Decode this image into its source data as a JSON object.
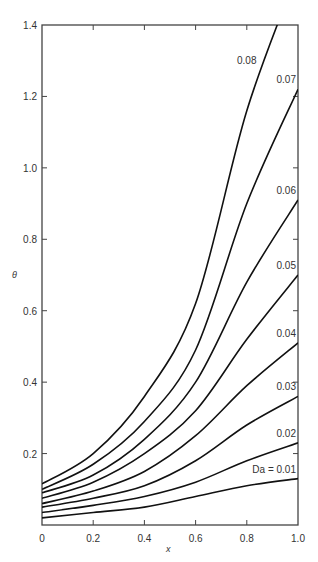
{
  "chart_data": {
    "type": "line",
    "title": "",
    "xlabel": "x",
    "ylabel": "θ",
    "xlim": [
      0,
      1.0
    ],
    "ylim": [
      0,
      1.4
    ],
    "grid": false,
    "legend": "inline labels at curve ends",
    "x_ticks": [
      "0",
      "0.2",
      "0.4",
      "0.6",
      "0.8",
      "1.0"
    ],
    "y_ticks": [
      "0.2",
      "0.4",
      "0.6",
      "0.8",
      "1.0",
      "1.2",
      "1.4"
    ],
    "x": [
      0,
      0.2,
      0.4,
      0.6,
      0.8,
      1.0
    ],
    "series": [
      {
        "name": "Da = 0.01",
        "label": "Da = 0.01",
        "values": [
          0.02,
          0.035,
          0.05,
          0.08,
          0.11,
          0.13
        ]
      },
      {
        "name": "0.02",
        "label": "0.02",
        "values": [
          0.035,
          0.055,
          0.08,
          0.12,
          0.18,
          0.23
        ]
      },
      {
        "name": "0.03",
        "label": "0.03",
        "values": [
          0.05,
          0.075,
          0.11,
          0.18,
          0.28,
          0.36
        ]
      },
      {
        "name": "0.04",
        "label": "0.04",
        "values": [
          0.06,
          0.095,
          0.15,
          0.25,
          0.39,
          0.51
        ]
      },
      {
        "name": "0.05",
        "label": "0.05",
        "values": [
          0.075,
          0.12,
          0.2,
          0.32,
          0.52,
          0.7
        ]
      },
      {
        "name": "0.06",
        "label": "0.06",
        "values": [
          0.09,
          0.14,
          0.24,
          0.4,
          0.68,
          0.91
        ]
      },
      {
        "name": "0.07",
        "label": "0.07",
        "values": [
          0.1,
          0.17,
          0.29,
          0.49,
          0.9,
          1.22
        ]
      },
      {
        "name": "0.08",
        "label": "0.08",
        "values": [
          0.115,
          0.2,
          0.36,
          0.62,
          1.16,
          1.55
        ]
      }
    ]
  },
  "axes": {
    "x_label": "x",
    "y_label": "θ"
  }
}
